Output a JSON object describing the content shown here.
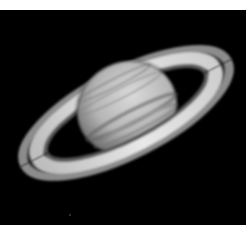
{
  "image": {
    "subject": "Saturn with rings",
    "description": "Grayscale telescope photograph of Saturn and its ring system against a black sky",
    "colors": {
      "background": "#000000",
      "border": "#ffffff",
      "planet_light": "#d8d8d8",
      "planet_dark": "#6a6a6a",
      "ring_bright": "#e6e6e6",
      "ring_outer": "#8a8a8a",
      "cassini_gap": "#111111"
    }
  }
}
